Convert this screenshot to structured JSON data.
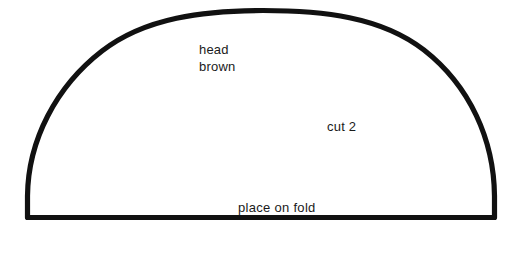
{
  "document": {
    "type": "sewing-pattern-piece",
    "title": "head brown pattern piece",
    "background_color": "#ffffff",
    "ink_color": "#111111"
  },
  "shape": {
    "name": "half-dome",
    "description": "flattened semicircular arc closed by a straight baseline",
    "stroke_color": "#111111",
    "stroke_width_px": 5,
    "baseline_y_px": 217,
    "left_x_px": 27,
    "right_x_px": 495,
    "apex_y_px": 11,
    "center_x_px": 261
  },
  "labels": {
    "piece_name": "head",
    "piece_color": "brown",
    "cut_instruction": "cut 2",
    "fold_instruction": "place on fold"
  }
}
